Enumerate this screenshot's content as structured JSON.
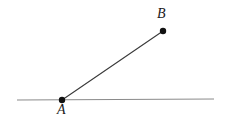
{
  "figure": {
    "background_color": "#ffffff",
    "width": 225,
    "height": 120
  },
  "labels": {
    "point_a": "A",
    "point_b": "B"
  },
  "colors": {
    "baseline_stroke": "#8a8a8a",
    "segment_stroke": "#3a3a3a",
    "point_fill": "#111111",
    "label_color": "#1a1a1a"
  },
  "geometry": {
    "baseline": {
      "name": "horizontal-line",
      "x1": 17,
      "y1": 100,
      "x2": 214,
      "y2": 99,
      "stroke_width": 1
    },
    "segment_ab": {
      "name": "segment-ab",
      "x1": 62,
      "y1": 100,
      "x2": 163,
      "y2": 31,
      "stroke_width": 1.1
    },
    "point_a": {
      "name": "point-a",
      "cx": 62,
      "cy": 100,
      "r": 3.2
    },
    "point_b": {
      "name": "point-b",
      "cx": 163,
      "cy": 31,
      "r": 3.2
    }
  }
}
